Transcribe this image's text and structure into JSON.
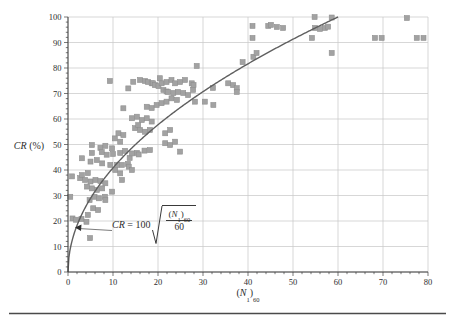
{
  "figure": {
    "bg": "#ffffff",
    "marker_fill": "#a2a2a2",
    "marker_edge": "#8f8f8f",
    "curve_color": "#5f5f5f",
    "grid_color": "#c9c9c9",
    "axis_color": "#3f3f3f",
    "text_color": "#2e2e2e",
    "rule_color": "#4a4a4a"
  },
  "labels": {
    "y_var": "CR",
    "y_rest": " (%)",
    "x_open": "(",
    "x_var": "N",
    "x_sub1": "1",
    "x_close": ")",
    "x_sub60": "60"
  },
  "equation": {
    "lhs": "CR",
    "rhs_prefix": "= 100",
    "num_open": "(",
    "num_var": "N",
    "num_sub1": "1",
    "num_close": ")",
    "num_sub60": "60",
    "den": "60"
  },
  "chart_data": {
    "type": "scatter",
    "title": "",
    "xlabel": "(N1)60",
    "ylabel": "CR (%)",
    "xlim": [
      0,
      80
    ],
    "ylim": [
      0,
      100
    ],
    "x_ticks": [
      0,
      10,
      20,
      30,
      40,
      50,
      60,
      70,
      80
    ],
    "y_ticks": [
      0,
      10,
      20,
      30,
      40,
      50,
      60,
      70,
      80,
      90,
      100
    ],
    "minor_tick_step": 2,
    "grid": true,
    "legend": "none",
    "curve": {
      "equation_text": "CR = 100*sqrt((N1)60/60)",
      "x_start": 0,
      "x_end": 60,
      "coefficient": 100,
      "divisor": 60
    },
    "annotation_arrow": {
      "x_px": 76.5,
      "y_px": 227.5,
      "to_x_px": 112,
      "to_y_px": 230.5
    },
    "points": [
      [
        0.5,
        29.5
      ],
      [
        0.9,
        37.5
      ],
      [
        1.0,
        21.0
      ],
      [
        1.8,
        20.5
      ],
      [
        2.7,
        36.8
      ],
      [
        3.0,
        20.8
      ],
      [
        3.1,
        44.6
      ],
      [
        3.1,
        38.0
      ],
      [
        3.8,
        36.1
      ],
      [
        4.1,
        19.7
      ],
      [
        4.2,
        33.5
      ],
      [
        4.4,
        22.4
      ],
      [
        4.4,
        38.8
      ],
      [
        4.8,
        28.2
      ],
      [
        4.9,
        13.3
      ],
      [
        5.0,
        43.3
      ],
      [
        5.0,
        35.5
      ],
      [
        5.3,
        49.8
      ],
      [
        5.3,
        46.7
      ],
      [
        5.3,
        32.8
      ],
      [
        5.6,
        25.0
      ],
      [
        5.9,
        29.5
      ],
      [
        6.1,
        36.1
      ],
      [
        6.4,
        43.9
      ],
      [
        6.4,
        32.2
      ],
      [
        6.7,
        24.3
      ],
      [
        6.9,
        28.9
      ],
      [
        7.2,
        48.7
      ],
      [
        7.2,
        35.7
      ],
      [
        7.5,
        47.0
      ],
      [
        7.6,
        42.6
      ],
      [
        7.6,
        32.8
      ],
      [
        8.2,
        29.5
      ],
      [
        8.3,
        49.5
      ],
      [
        8.3,
        34.8
      ],
      [
        8.3,
        28.2
      ],
      [
        8.6,
        46.0
      ],
      [
        9.3,
        74.9
      ],
      [
        9.4,
        42.0
      ],
      [
        9.8,
        48.5
      ],
      [
        9.8,
        31.5
      ],
      [
        10.0,
        46.3
      ],
      [
        10.4,
        52.4
      ],
      [
        10.5,
        40.0
      ],
      [
        10.9,
        42.0
      ],
      [
        11.2,
        54.4
      ],
      [
        11.6,
        46.7
      ],
      [
        11.6,
        38.7
      ],
      [
        11.6,
        51.1
      ],
      [
        12.0,
        42.0
      ],
      [
        12.0,
        36.1
      ],
      [
        12.3,
        64.2
      ],
      [
        12.3,
        53.7
      ],
      [
        12.7,
        47.5
      ],
      [
        13.3,
        42.4
      ],
      [
        13.4,
        72.0
      ],
      [
        13.5,
        41.3
      ],
      [
        13.7,
        44.7
      ],
      [
        14.2,
        60.3
      ],
      [
        14.2,
        46.5
      ],
      [
        14.2,
        40.0
      ],
      [
        14.5,
        74.6
      ],
      [
        14.9,
        56.4
      ],
      [
        15.3,
        60.9
      ],
      [
        15.3,
        46.7
      ],
      [
        15.6,
        57.6
      ],
      [
        15.7,
        46.1
      ],
      [
        16.0,
        75.3
      ],
      [
        16.0,
        55.7
      ],
      [
        16.4,
        59.6
      ],
      [
        17.0,
        47.6
      ],
      [
        17.1,
        74.9
      ],
      [
        17.1,
        55.0
      ],
      [
        17.5,
        64.8
      ],
      [
        17.5,
        60.3
      ],
      [
        17.8,
        74.5
      ],
      [
        18.2,
        55.7
      ],
      [
        18.2,
        47.8
      ],
      [
        18.6,
        74.0
      ],
      [
        18.6,
        64.3
      ],
      [
        18.6,
        59.0
      ],
      [
        18.9,
        74.0
      ],
      [
        19.3,
        73.3
      ],
      [
        19.7,
        65.5
      ],
      [
        20.1,
        72.9
      ],
      [
        20.4,
        76.0
      ],
      [
        20.8,
        74.0
      ],
      [
        20.8,
        66.2
      ],
      [
        21.2,
        71.4
      ],
      [
        21.6,
        54.4
      ],
      [
        21.6,
        50.5
      ],
      [
        21.9,
        74.5
      ],
      [
        21.9,
        70.8
      ],
      [
        21.9,
        66.8
      ],
      [
        22.2,
        70.6
      ],
      [
        22.7,
        49.8
      ],
      [
        22.7,
        55.7
      ],
      [
        23.0,
        75.3
      ],
      [
        23.0,
        68.1
      ],
      [
        23.4,
        70.2
      ],
      [
        23.8,
        74.0
      ],
      [
        23.8,
        51.1
      ],
      [
        24.2,
        67.5
      ],
      [
        24.4,
        70.6
      ],
      [
        24.9,
        74.5
      ],
      [
        24.9,
        47.2
      ],
      [
        25.6,
        70.2
      ],
      [
        26.0,
        75.3
      ],
      [
        26.7,
        69.4
      ],
      [
        27.5,
        74.0
      ],
      [
        27.8,
        71.4
      ],
      [
        27.9,
        73.3
      ],
      [
        28.2,
        66.8
      ],
      [
        28.6,
        80.8
      ],
      [
        30.4,
        66.8
      ],
      [
        32.2,
        72.2
      ],
      [
        32.3,
        65.5
      ],
      [
        35.6,
        74.0
      ],
      [
        36.7,
        73.3
      ],
      [
        37.5,
        72.1
      ],
      [
        37.5,
        70.6
      ],
      [
        38.8,
        82.3
      ],
      [
        41.0,
        96.5
      ],
      [
        41.0,
        91.8
      ],
      [
        41.2,
        84.4
      ],
      [
        41.9,
        85.9
      ],
      [
        44.5,
        96.5
      ],
      [
        45.1,
        96.9
      ],
      [
        46.4,
        96.1
      ],
      [
        47.8,
        95.7
      ],
      [
        54.2,
        91.8
      ],
      [
        54.8,
        100.0
      ],
      [
        54.9,
        95.7
      ],
      [
        56.0,
        95.3
      ],
      [
        57.1,
        95.7
      ],
      [
        57.8,
        96.2
      ],
      [
        58.6,
        99.8
      ],
      [
        58.6,
        85.9
      ],
      [
        68.2,
        91.8
      ],
      [
        69.7,
        91.8
      ],
      [
        75.3,
        99.6
      ],
      [
        77.5,
        91.8
      ],
      [
        79.0,
        91.8
      ]
    ]
  }
}
